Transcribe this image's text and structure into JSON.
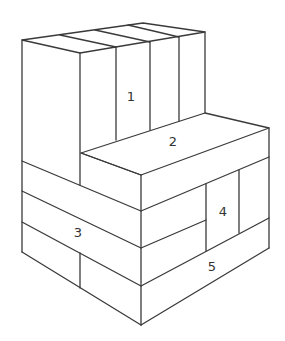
{
  "diagram": {
    "type": "isometric block structure",
    "line_color": "#3a3a3a",
    "background": "#ffffff",
    "labels": [
      {
        "id": "1",
        "text": "1",
        "x": 131,
        "y": 97
      },
      {
        "id": "2",
        "text": "2",
        "x": 173,
        "y": 142
      },
      {
        "id": "3",
        "text": "3",
        "x": 78,
        "y": 233
      },
      {
        "id": "4",
        "text": "4",
        "x": 223,
        "y": 212
      },
      {
        "id": "5",
        "text": "5",
        "x": 212,
        "y": 267
      }
    ]
  }
}
